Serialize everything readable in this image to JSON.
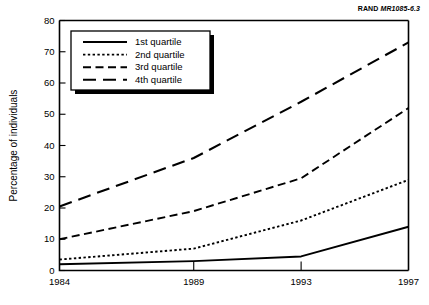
{
  "figure": {
    "source_note": {
      "brand": "RAND",
      "code": "MR1085-6.3"
    }
  },
  "chart_data": {
    "type": "line",
    "title": "",
    "subtitle": "",
    "xlabel": "",
    "ylabel": "Percentage of individuals",
    "x": [
      1984,
      1989,
      1993,
      1997
    ],
    "xtick_labels": [
      "1984",
      "1989",
      "1993",
      "1997"
    ],
    "ytick_labels": [
      "0",
      "10",
      "20",
      "30",
      "40",
      "50",
      "60",
      "70",
      "80"
    ],
    "yticks": [
      0,
      10,
      20,
      30,
      40,
      50,
      60,
      70,
      80
    ],
    "xlim": [
      1984,
      1997
    ],
    "ylim": [
      0,
      80
    ],
    "grid": false,
    "legend_position": "upper-left",
    "series": [
      {
        "name": "1st quartile",
        "label": "1st quartile",
        "style": "solid",
        "values": [
          2,
          3,
          4.5,
          14
        ]
      },
      {
        "name": "2nd quartile",
        "label": "2nd quartile",
        "style": "dotted",
        "values": [
          3.5,
          7,
          16,
          29
        ]
      },
      {
        "name": "3rd quartile",
        "label": "3rd quartile",
        "style": "dashed",
        "values": [
          10,
          19,
          29.5,
          52
        ]
      },
      {
        "name": "4th quartile",
        "label": "4th quartile",
        "style": "long-dashed",
        "values": [
          20.5,
          36,
          54,
          73
        ]
      }
    ]
  }
}
